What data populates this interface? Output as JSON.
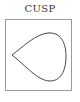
{
  "title": "CUSP",
  "diagram": {
    "shape": "teardrop-cusp-curve",
    "stroke_color": "#444444",
    "frame_color": "#9a9a9a"
  }
}
